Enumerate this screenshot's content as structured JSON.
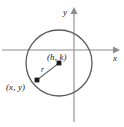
{
  "figure": {
    "type": "geometry-diagram",
    "background_color": "#ffffff",
    "axes": {
      "x_label": "x",
      "y_label": "y",
      "axis_color": "#8d8d8d",
      "x_axis_y_px": 50,
      "y_axis_x_px": 74,
      "x_arrow_direction": "right",
      "y_arrow_direction": "up"
    },
    "circle": {
      "center_px": [
        59,
        63
      ],
      "radius_px": 33,
      "stroke_color": "#5c5c5c",
      "fill": "none"
    },
    "labels": {
      "center": "(h, k)",
      "point": "(x, y)",
      "radius": "r"
    },
    "points": [
      {
        "name": "center",
        "label": "(h, k)",
        "px": [
          59,
          63
        ]
      },
      {
        "name": "on-circle",
        "label": "(x, y)",
        "px": [
          37,
          80
        ]
      }
    ],
    "radius_segment": {
      "from_px": [
        59,
        63
      ],
      "to_px": [
        37,
        80
      ],
      "label": "r",
      "stroke_color": "#6a6a6a"
    }
  }
}
